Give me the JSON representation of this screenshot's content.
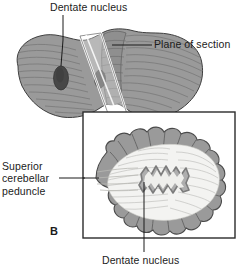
{
  "figure": {
    "kind": "anatomy-illustration",
    "panel_letter": "B",
    "background_color": "#ffffff",
    "ink_color": "#1b1b1b"
  },
  "labels": {
    "dentate_nucleus_top": "Dentate nucleus",
    "plane_of_section": "Plane of section",
    "superior_cerebellar_peduncle_line1": "Superior",
    "superior_cerebellar_peduncle_line2": "cerebellar",
    "superior_cerebellar_peduncle_line3": "peduncle",
    "dentate_nucleus_bottom": "Dentate nucleus",
    "panel_b": "B"
  },
  "colors": {
    "cortex_gray": "#9a9a9a",
    "cortex_gray_dark": "#818181",
    "nucleus_dark": "#4a4a4a",
    "white_matter": "#f2f2f0",
    "dentate_band": "#a9a9a9",
    "outline": "#3a3a3a",
    "box_border": "#2b2b2b",
    "leader_line": "#1b1b1b",
    "plane_fill": "#ffffff"
  },
  "panel_a": {
    "name": "superior-view-cerebellum",
    "description": "Superior view of cerebellum with two hemispheres, vermis, horizontal folia striations, and two dark oval dentate nuclei",
    "dentate_nuclei_count": 2,
    "plane_of_section_shape": "slanted-parallelogram"
  },
  "panel_b": {
    "name": "cerebellum-cross-section",
    "description": "Horizontal section of cerebellum showing lobulated gray cortex, branching white matter, superior cerebellar peduncle, and serrated dentate nucleus",
    "box": {
      "x": 83,
      "y": 112,
      "width": 152,
      "height": 126
    }
  }
}
